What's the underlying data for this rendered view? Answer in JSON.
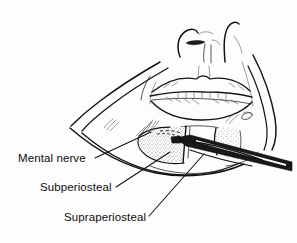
{
  "figure": {
    "domain_kind": "anatomical-line-illustration",
    "background_color": "#fdfdfd",
    "ink_color": "#131313",
    "stipple_color": "#555555",
    "instrument_color": "#181818",
    "width": 297,
    "height": 243
  },
  "labels": [
    {
      "id": "mental-nerve",
      "text": "Mental nerve",
      "x": 18,
      "y": 162,
      "leader_from": [
        95,
        158
      ],
      "leader_to": [
        151,
        132
      ]
    },
    {
      "id": "subperiosteal",
      "text": "Subperiosteal",
      "x": 40,
      "y": 191,
      "leader_from": [
        116,
        187
      ],
      "leader_to": [
        170,
        152
      ]
    },
    {
      "id": "supraperiosteal",
      "text": "Supraperiosteal",
      "x": 64,
      "y": 221,
      "leader_from": [
        149,
        216
      ],
      "leader_to": [
        204,
        154
      ]
    }
  ],
  "regions": [
    {
      "id": "flap-left-stippled",
      "name": "left reflected mucosal flap",
      "kind": "stippled-tissue"
    },
    {
      "id": "flap-right-stippled",
      "name": "right reflected mucosal flap",
      "kind": "stippled-tissue"
    },
    {
      "id": "retractor-instrument",
      "name": "surgical retractor blade",
      "kind": "instrument"
    },
    {
      "id": "nose",
      "name": "nose with nostrils",
      "kind": "outline"
    },
    {
      "id": "lips",
      "name": "upper and lower lip with teeth",
      "kind": "outline"
    },
    {
      "id": "chin-jaw-contour",
      "name": "chin and jaw contour lines",
      "kind": "outline"
    }
  ]
}
